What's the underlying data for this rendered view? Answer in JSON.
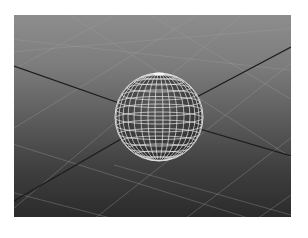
{
  "viewport": {
    "type": "3d-perspective-viewport",
    "background_top": "#8d8d8d",
    "background_bottom": "#2b2b2b",
    "grid_color": "#9a9a9a",
    "axis_color": "#1a1a1a"
  },
  "scene": {
    "objects": [
      {
        "name": "sphere",
        "display": "wireframe",
        "wire_color": "#e8e8e8",
        "shade_color": "#3c3c3c"
      }
    ],
    "ground_grid": true
  }
}
